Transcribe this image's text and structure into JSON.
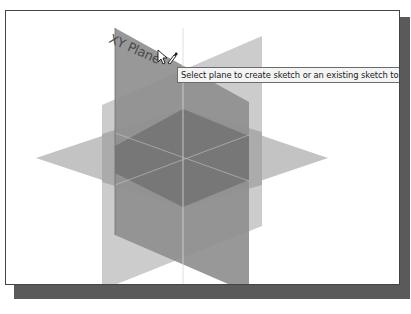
{
  "viewport": {
    "planes": [
      {
        "name": "XY Plane",
        "label": "XY Plane",
        "color": "#8c8c8c",
        "highlighted": true
      },
      {
        "name": "YZ Plane",
        "color": "#c4c4c4"
      },
      {
        "name": "XZ Plane",
        "color": "#bdbdbd"
      }
    ],
    "hover_label": "XY Plane"
  },
  "tooltip": {
    "text": "Select plane to create sketch or an existing sketch to edit"
  },
  "colors": {
    "frame_border": "#444444",
    "shadow": "#5a5a5a",
    "xy_plane": "#8c8c8c",
    "yz_plane": "#c4c4c4",
    "xz_plane": "#bdbdbd",
    "overlap": "#7a7a7a"
  }
}
